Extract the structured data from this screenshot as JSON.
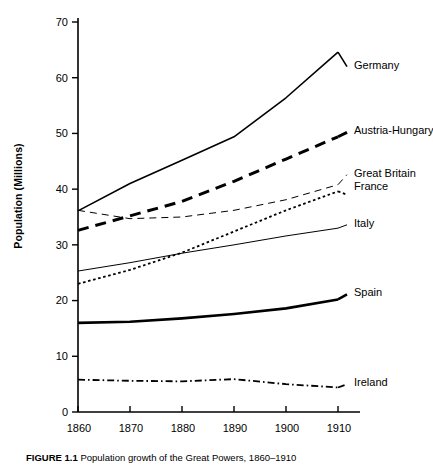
{
  "figure": {
    "caption_label": "FIGURE 1.1",
    "caption_text": "Population growth of the Great Powers, 1860–1910"
  },
  "axes": {
    "ylabel": "Population (Millions)",
    "yticks": [
      "0",
      "10",
      "20",
      "30",
      "40",
      "50",
      "60",
      "70"
    ],
    "xticks": [
      "1860",
      "1870",
      "1880",
      "1890",
      "1900",
      "1910"
    ],
    "ylim": [
      0,
      70
    ],
    "xlim": [
      1860,
      1910
    ],
    "grid": false,
    "line_color": "#000000"
  },
  "chart_data": {
    "type": "line",
    "title": "Population growth of the Great Powers, 1860–1910",
    "xlabel": "",
    "ylabel": "Population (Millions)",
    "x": [
      1860,
      1870,
      1880,
      1890,
      1900,
      1910
    ],
    "xlim": [
      1860,
      1910
    ],
    "ylim": [
      0,
      70
    ],
    "grid": false,
    "legend_position": "right-inline",
    "series": [
      {
        "name": "Germany",
        "values": [
          36.1,
          41.0,
          45.2,
          49.4,
          56.4,
          64.6
        ],
        "style": "solid",
        "width": 1.6,
        "label_y": 62.0
      },
      {
        "name": "Austria-Hungary",
        "values": [
          32.6,
          35.2,
          37.8,
          41.4,
          45.4,
          49.4
        ],
        "style": "dashed-thick",
        "width": 3.0,
        "label_y": 50.2
      },
      {
        "name": "Great Britain",
        "values": [
          36.2,
          34.7,
          35.0,
          36.2,
          38.1,
          40.8
        ],
        "style": "dashed-thin",
        "width": 1.0,
        "label_y": 42.6
      },
      {
        "name": "France",
        "values": [
          23.0,
          25.5,
          28.6,
          32.4,
          36.2,
          39.6
        ],
        "style": "dotted",
        "width": 1.8,
        "label_y": 39.0
      },
      {
        "name": "Italy",
        "values": [
          25.3,
          26.8,
          28.5,
          30.0,
          31.6,
          33.0
        ],
        "style": "solid",
        "width": 1.0,
        "label_y": 33.6
      },
      {
        "name": "Spain",
        "values": [
          16.0,
          16.2,
          16.8,
          17.6,
          18.6,
          20.2
        ],
        "style": "solid",
        "width": 2.6,
        "label_y": 21.1
      },
      {
        "name": "Ireland",
        "values": [
          5.8,
          5.6,
          5.5,
          5.9,
          5.0,
          4.4
        ],
        "style": "dash-dot",
        "width": 1.8,
        "label_y": 5.0
      }
    ]
  }
}
